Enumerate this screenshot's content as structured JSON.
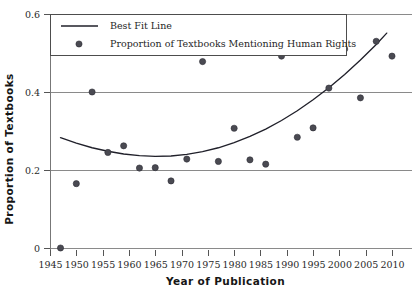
{
  "chart_data": {
    "type": "scatter",
    "title": "",
    "xlabel": "Year of Publication",
    "ylabel": "Proportion of Textbooks",
    "xlim": [
      1944,
      2011
    ],
    "ylim": [
      0,
      0.6
    ],
    "grid": true,
    "xticks": [
      1945,
      1950,
      1955,
      1960,
      1965,
      1970,
      1975,
      1980,
      1985,
      1990,
      1995,
      2000,
      2005,
      2010
    ],
    "xticklabels": [
      "1945",
      "1950",
      "1955",
      "1960",
      "1965",
      "1970",
      "1975",
      "1980",
      "1985",
      "1990",
      "1995",
      "2000",
      "2005",
      "2010"
    ],
    "yticks": [
      0,
      0.2,
      0.4,
      0.6
    ],
    "yticklabels": [
      "0",
      "0.2",
      "0.4",
      "0.6"
    ],
    "legend_position": "upper-left",
    "legend": [
      {
        "label": "Best Fit Line",
        "marker": "line",
        "color": "#20202a"
      },
      {
        "label": "Proportion of Textbooks Mentioning Human Rights",
        "marker": "circle",
        "color": "#4a4a52"
      }
    ],
    "series": [
      {
        "name": "Proportion of Textbooks Mentioning Human Rights",
        "marker": "circle",
        "color": "#4a4a52",
        "x": [
          1947,
          1950,
          1953,
          1956,
          1959,
          1962,
          1965,
          1968,
          1971,
          1974,
          1977,
          1980,
          1983,
          1986,
          1989,
          1992,
          1995,
          1998,
          2001,
          2004,
          2007,
          2010
        ],
        "y": [
          0.0,
          0.165,
          0.4,
          0.245,
          0.262,
          0.205,
          0.206,
          0.172,
          0.228,
          0.478,
          0.222,
          0.307,
          0.226,
          0.215,
          0.492,
          0.284,
          0.308,
          0.41,
          0.51,
          0.385,
          0.53,
          0.492
        ]
      },
      {
        "name": "Best Fit Line",
        "marker": "line",
        "color": "#20202a",
        "x": [
          1947,
          1950,
          1953,
          1956,
          1959,
          1962,
          1965,
          1968,
          1971,
          1974,
          1977,
          1980,
          1983,
          1986,
          1989,
          1992,
          1995,
          1998,
          2001,
          2004,
          2007,
          2009
        ],
        "y": [
          0.283,
          0.269,
          0.257,
          0.248,
          0.241,
          0.237,
          0.235,
          0.236,
          0.24,
          0.247,
          0.257,
          0.27,
          0.286,
          0.305,
          0.327,
          0.352,
          0.38,
          0.411,
          0.445,
          0.482,
          0.522,
          0.551
        ]
      }
    ]
  },
  "axes": {
    "ylabel": "Proportion of Textbooks",
    "xlabel": "Year of Publication"
  }
}
